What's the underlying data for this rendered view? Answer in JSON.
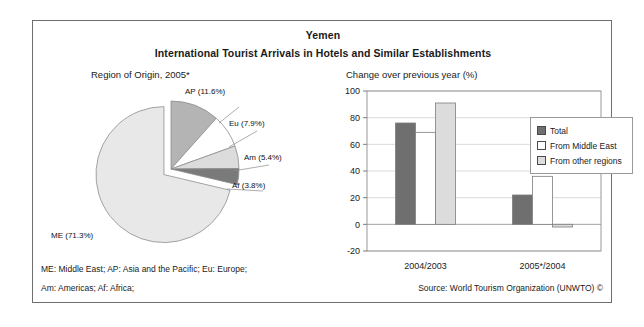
{
  "figure": {
    "title": "Yemen",
    "subtitle": "International Tourist Arrivals in Hotels and Similar Establishments",
    "pie_heading": "Region of Origin, 2005*",
    "bar_heading": "Change over previous year (%)",
    "footnote_line1": "ME: Middle East; AP: Asia and the Pacific; Eu: Europe;",
    "footnote_line2": "Am: Americas; Af: Africa;",
    "source": "Source: World Tourism Organization (UNWTO) ©"
  },
  "legend": {
    "items": [
      {
        "label": "Total",
        "color": "#6f6f6f"
      },
      {
        "label": "From Middle East",
        "color": "#ffffff"
      },
      {
        "label": "From other regions",
        "color": "#dcdcdc"
      }
    ]
  },
  "chart_data": [
    {
      "type": "pie",
      "title": "Region of Origin, 2005*",
      "categories": [
        "ME",
        "AP",
        "Eu",
        "Am",
        "Af"
      ],
      "values": [
        71.3,
        11.6,
        7.9,
        5.4,
        3.8
      ],
      "labels": [
        "ME (71.3%)",
        "AP (11.6%)",
        "Eu (7.9%)",
        "Am (5.4%)",
        "Af (3.8%)"
      ],
      "colors": [
        "#e8e8e8",
        "#b4b4b4",
        "#ffffff",
        "#dcdcdc",
        "#7a7a7a"
      ],
      "exploded": [
        "ME"
      ],
      "legend_position": "labels-outside",
      "unit": "%"
    },
    {
      "type": "bar",
      "title": "Change over previous year (%)",
      "categories": [
        "2004/2003",
        "2005*/2004"
      ],
      "series": [
        {
          "name": "Total",
          "values": [
            76,
            22
          ],
          "color": "#6f6f6f"
        },
        {
          "name": "From Middle East",
          "values": [
            69,
            36
          ],
          "color": "#ffffff"
        },
        {
          "name": "From other regions",
          "values": [
            91,
            -2
          ],
          "color": "#dcdcdc"
        }
      ],
      "xlabel": "",
      "ylabel": "",
      "ylim": [
        -20,
        100
      ],
      "yticks": [
        -20,
        0,
        20,
        40,
        60,
        80,
        100
      ],
      "ytick_labels": [
        "-20",
        "0",
        "20",
        "40",
        "60",
        "80",
        "100"
      ],
      "grid": true,
      "legend_position": "right"
    }
  ]
}
